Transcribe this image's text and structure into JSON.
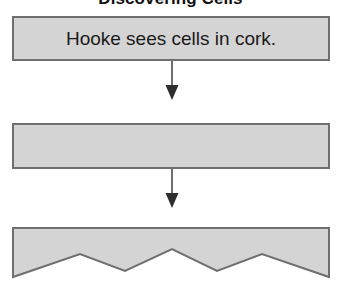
{
  "page": {
    "title": "Discovering Cells",
    "background_color": "#ffffff",
    "width": 341,
    "height": 292
  },
  "style": {
    "box_fill": "#d4d4d4",
    "box_border": "#6f6f6f",
    "text_color": "#1a1a1a",
    "arrow_color": "#444444"
  },
  "flowchart": {
    "type": "vertical-flow",
    "steps": [
      {
        "id": "step-1",
        "label": "Hooke sees cells in cork.",
        "filled": true,
        "torn_bottom": false
      },
      {
        "id": "step-2",
        "label": "",
        "filled": false,
        "torn_bottom": false
      },
      {
        "id": "step-3",
        "label": "",
        "filled": false,
        "torn_bottom": true
      }
    ],
    "connectors": [
      {
        "id": "connector-1",
        "from": "step-1",
        "to": "step-2",
        "direction": "down"
      },
      {
        "id": "connector-2",
        "from": "step-2",
        "to": "step-3",
        "direction": "down"
      }
    ]
  }
}
